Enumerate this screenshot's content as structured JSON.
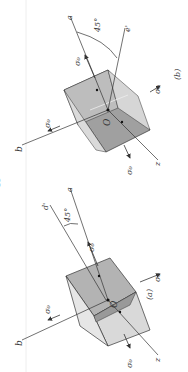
{
  "figure": {
    "colors": {
      "background": "#ffffff",
      "face_dark": "#9a9a9a",
      "face_mid": "#b5b5b5",
      "face_light": "#dcdcdc",
      "line": "#333333"
    },
    "panels": [
      {
        "id": "b",
        "caption": "(b)",
        "angle_label": "45°",
        "axis_a": "a",
        "axis_b": "b",
        "axis_z": "z",
        "axis_rot": "e'",
        "stress_label": "σ₀",
        "origin_label": "O"
      },
      {
        "id": "a",
        "caption": "(a)",
        "angle_label": "45°",
        "axis_a": "a",
        "axis_b": "b",
        "axis_z": "z",
        "axis_rot": "d'",
        "stress_label": "σ₀",
        "origin_label": "O"
      }
    ]
  }
}
